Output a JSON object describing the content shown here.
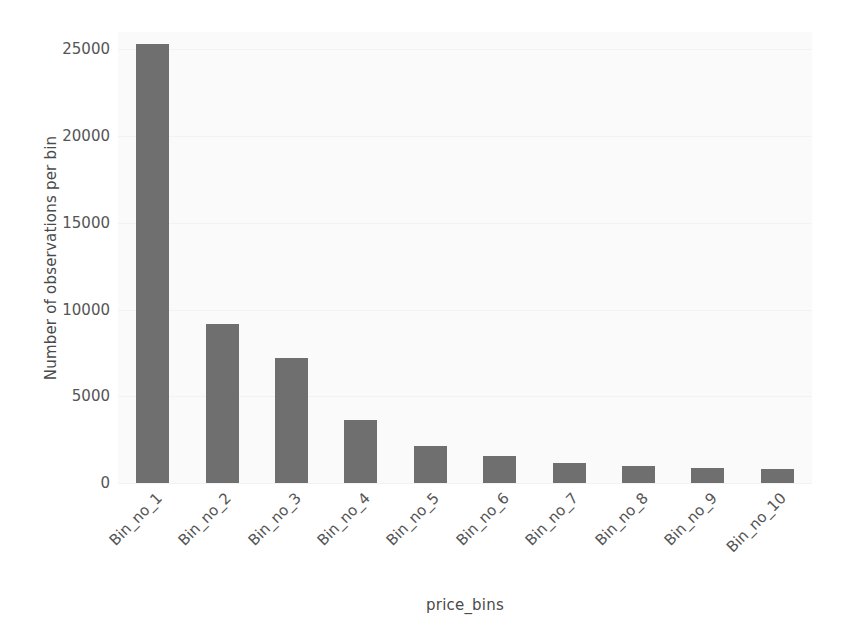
{
  "chart_data": {
    "type": "bar",
    "title": "",
    "xlabel": "price_bins",
    "ylabel": "Number of observations per bin",
    "categories": [
      "Bin_no_1",
      "Bin_no_2",
      "Bin_no_3",
      "Bin_no_4",
      "Bin_no_5",
      "Bin_no_6",
      "Bin_no_7",
      "Bin_no_8",
      "Bin_no_9",
      "Bin_no_10"
    ],
    "values": [
      25300,
      9150,
      7200,
      3650,
      2150,
      1570,
      1130,
      980,
      860,
      810
    ],
    "ylim": [
      0,
      26000
    ],
    "yticks": [
      0,
      5000,
      10000,
      15000,
      20000,
      25000
    ],
    "ytick_labels": [
      "0",
      "5000",
      "10000",
      "15000",
      "20000",
      "25000"
    ],
    "grid": true,
    "legend": "none",
    "bar_color": "#6f6f6f",
    "plot_background": "#fbfbfb",
    "xtick_rotation": "-45"
  }
}
